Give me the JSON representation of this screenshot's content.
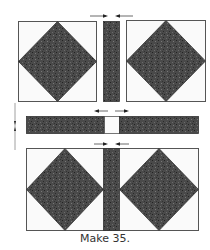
{
  "diagram": {
    "caption": "Make 35.",
    "colors": {
      "dark_fabric": "#4a4a4a",
      "light_fabric": "#fafafa",
      "outline": "#555555",
      "arrow": "#444444"
    },
    "top_row": {
      "pieces": [
        "square-in-square unit",
        "dark sashing strip",
        "square-in-square unit"
      ],
      "pressing_arrows": [
        "right",
        "left"
      ]
    },
    "middle_row": {
      "pieces": [
        "dark sashing strip",
        "light cornerstone square",
        "dark sashing strip"
      ],
      "pressing_arrows": [
        "left",
        "right"
      ]
    },
    "bottom_row": {
      "pieces": [
        "square-in-square unit",
        "dark sashing strip",
        "square-in-square unit"
      ],
      "pressing_arrows": [
        "right",
        "left"
      ]
    },
    "row_pressing_arrow": "down-up"
  }
}
